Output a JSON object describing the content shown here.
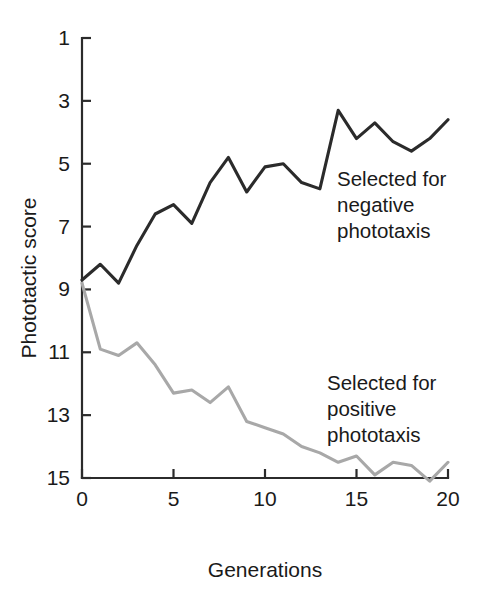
{
  "chart_data": {
    "type": "line",
    "title": "",
    "xlabel": "Generations",
    "ylabel": "Phototactic score",
    "xlim": [
      0,
      20
    ],
    "ylim": [
      1,
      15
    ],
    "y_inverted": true,
    "grid": false,
    "legend_position": "inline-annotations",
    "x_ticks": [
      "0",
      "5",
      "10",
      "15",
      "20"
    ],
    "x_tick_values": [
      0,
      5,
      10,
      15,
      20
    ],
    "y_ticks": [
      "1",
      "3",
      "5",
      "7",
      "9",
      "11",
      "13",
      "15"
    ],
    "y_tick_values": [
      1,
      3,
      5,
      7,
      9,
      11,
      13,
      15
    ],
    "x": [
      0,
      1,
      2,
      3,
      4,
      5,
      6,
      7,
      8,
      9,
      10,
      11,
      12,
      13,
      14,
      15,
      16,
      17,
      18,
      19,
      20
    ],
    "series": [
      {
        "name": "Selected for negative phototaxis",
        "color": "#2b2b2b",
        "annotation": "Selected for\nnegative\nphototaxis",
        "annotation_lines": [
          "Selected for",
          "negative",
          "phototaxis"
        ],
        "values": [
          8.7,
          8.2,
          8.8,
          7.6,
          6.6,
          6.3,
          6.9,
          5.6,
          4.8,
          5.9,
          5.1,
          5.0,
          5.6,
          5.8,
          3.3,
          4.2,
          3.7,
          4.3,
          4.6,
          4.2,
          3.6
        ]
      },
      {
        "name": "Selected for positive phototaxis",
        "color": "#a8a8a8",
        "annotation": "Selected for\npositive\nphototaxis",
        "annotation_lines": [
          "Selected for",
          "positive",
          "phototaxis"
        ],
        "values": [
          8.8,
          10.9,
          11.1,
          10.7,
          11.4,
          12.3,
          12.2,
          12.6,
          12.1,
          13.2,
          13.4,
          13.6,
          14.0,
          14.2,
          14.5,
          14.3,
          14.9,
          14.5,
          14.6,
          15.1,
          14.5
        ]
      }
    ],
    "annotations": [
      {
        "id": "negative-label",
        "lines": [
          "Selected for",
          "negative",
          "phototaxis"
        ],
        "x_px": 337,
        "y_px": 186
      },
      {
        "id": "positive-label",
        "lines": [
          "Selected for",
          "positive",
          "phototaxis"
        ],
        "x_px": 327,
        "y_px": 390
      }
    ]
  },
  "axes": {
    "x_title": "Generations",
    "y_title": "Phototactic score"
  }
}
